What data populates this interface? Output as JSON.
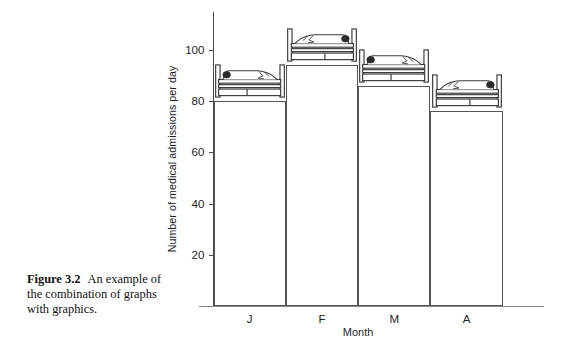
{
  "caption": {
    "figure_number": "Figure 3.2",
    "text": "An example of the combination of graphs with graphics."
  },
  "chart_data": {
    "type": "bar",
    "title": "",
    "xlabel": "Month",
    "ylabel": "Number of medical admissions per day",
    "categories": [
      "J",
      "F",
      "M",
      "A"
    ],
    "values": [
      80,
      94,
      86,
      76
    ],
    "ylim": [
      0,
      106
    ],
    "yticks": [
      20,
      40,
      60,
      80,
      100
    ],
    "grid": false,
    "legend": "none",
    "annotations": [
      {
        "series": "J",
        "graphic": "hospital-bed-with-patient",
        "orientation": "head-left"
      },
      {
        "series": "F",
        "graphic": "hospital-bed-with-patient",
        "orientation": "head-right"
      },
      {
        "series": "M",
        "graphic": "hospital-bed-with-patient",
        "orientation": "head-left"
      },
      {
        "series": "A",
        "graphic": "hospital-bed-with-patient",
        "orientation": "head-right"
      }
    ],
    "colors": {
      "bar_fill": "#ffffff",
      "bar_stroke": "#555555",
      "axis": "#4a4a4a",
      "text": "#1f1f1f"
    }
  }
}
